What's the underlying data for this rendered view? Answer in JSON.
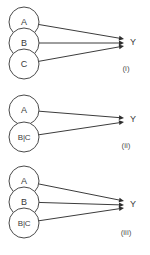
{
  "figure": {
    "background_color": "#ffffff",
    "stroke_color": "#3c3c3c",
    "text_color": "#3a3a3a",
    "panels": [
      {
        "caption": "(i)",
        "caption_x": 126,
        "caption_y": 68,
        "target": {
          "label": "Y",
          "x": 124,
          "y": 43,
          "label_x": 130,
          "label_y": 42
        },
        "nodes": [
          {
            "label": "A",
            "x": 24,
            "y": 22,
            "r": 15,
            "multiline": false
          },
          {
            "label": "B",
            "x": 24,
            "y": 43,
            "r": 15,
            "multiline": false
          },
          {
            "label": "C",
            "x": 24,
            "y": 64,
            "r": 15,
            "multiline": false
          }
        ],
        "edges": [
          {
            "from": 0,
            "to_offset": -4
          },
          {
            "from": 1,
            "to_offset": 0
          },
          {
            "from": 2,
            "to_offset": 3
          }
        ]
      },
      {
        "caption": "(ii)",
        "caption_x": 126,
        "caption_y": 145,
        "target": {
          "label": "Y",
          "x": 124,
          "y": 120,
          "label_x": 130,
          "label_y": 119
        },
        "nodes": [
          {
            "label": "A",
            "x": 24,
            "y": 110,
            "r": 15,
            "multiline": false
          },
          {
            "label": "B|C",
            "x": 24,
            "y": 137,
            "r": 15,
            "multiline": true
          }
        ],
        "edges": [
          {
            "from": 0,
            "to_offset": -2
          },
          {
            "from": 1,
            "to_offset": 2
          }
        ]
      },
      {
        "caption": "(iii)",
        "caption_x": 126,
        "caption_y": 232,
        "target": {
          "label": "Y",
          "x": 124,
          "y": 205,
          "label_x": 130,
          "label_y": 204
        },
        "nodes": [
          {
            "label": "A",
            "x": 24,
            "y": 181,
            "r": 15,
            "multiline": false
          },
          {
            "label": "B",
            "x": 24,
            "y": 202,
            "r": 15,
            "multiline": false
          },
          {
            "label": "B|C",
            "x": 24,
            "y": 223,
            "r": 15,
            "multiline": true
          }
        ],
        "edges": [
          {
            "from": 0,
            "to_offset": -4
          },
          {
            "from": 1,
            "to_offset": 0
          },
          {
            "from": 2,
            "to_offset": 3
          }
        ]
      }
    ]
  }
}
